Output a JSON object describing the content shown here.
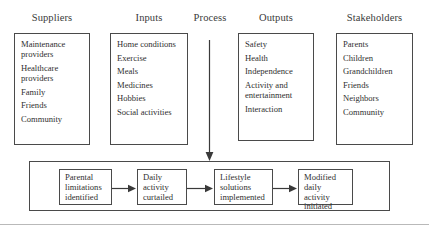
{
  "diagram": {
    "columns": [
      {
        "header": "Suppliers",
        "items": [
          "Maintenance\nproviders",
          "Healthcare\nproviders",
          "Family",
          "Friends",
          "Community"
        ]
      },
      {
        "header": "Inputs",
        "items": [
          "Home conditions",
          "Exercise",
          "Meals",
          "Medicines",
          "Hobbies",
          "Social activities"
        ]
      },
      {
        "header": "Process",
        "items": []
      },
      {
        "header": "Outputs",
        "items": [
          "Safety",
          "Health",
          "Independence",
          "Activity and\nentertainment",
          "Interaction"
        ]
      },
      {
        "header": "Stakeholders",
        "items": [
          "Parents",
          "Children",
          "Grandchildren",
          "Friends",
          "Neighbors",
          "Community"
        ]
      }
    ],
    "process_flow": {
      "steps": [
        "Parental\nlimitations\nidentified",
        "Daily\nactivity\ncurtailed",
        "Lifestyle\nsolutions\nimplemented",
        "Modified\ndaily activity\ninitiated"
      ]
    },
    "colors": {
      "border": "#4a4a4a",
      "text": "#2f2f2f",
      "background": "#ffffff",
      "rule": "#b9b9b9"
    }
  }
}
